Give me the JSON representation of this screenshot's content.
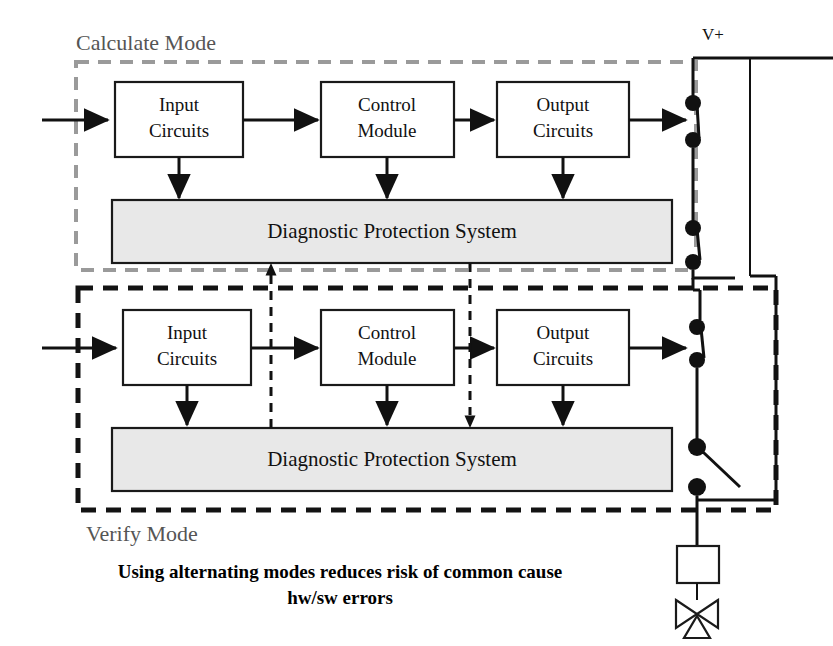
{
  "diagram": {
    "caption_line1": "Using alternating modes reduces risk of common cause",
    "caption_line2": "hw/sw errors",
    "power_rail_label": "V+",
    "colors": {
      "calculate_boundary": "#9a9a9a",
      "verify_boundary": "#131313",
      "dps_fill": "#e8e8e8",
      "block_fill": "#ffffff",
      "wire": "#111111"
    },
    "modes": [
      {
        "id": "calculate",
        "label": "Calculate Mode",
        "boundary_style": "dashed-gray",
        "blocks": [
          {
            "id": "input",
            "line1": "Input",
            "line2": "Circuits"
          },
          {
            "id": "control",
            "line1": "Control",
            "line2": "Module"
          },
          {
            "id": "output",
            "line1": "Output",
            "line2": "Circuits"
          }
        ],
        "diagnostic_bar": "Diagnostic Protection System"
      },
      {
        "id": "verify",
        "label": "Verify Mode",
        "boundary_style": "dashed-black",
        "blocks": [
          {
            "id": "input",
            "line1": "Input",
            "line2": "Circuits"
          },
          {
            "id": "control",
            "line1": "Control",
            "line2": "Module"
          },
          {
            "id": "output",
            "line1": "Output",
            "line2": "Circuits"
          }
        ],
        "diagnostic_bar": "Diagnostic Protection System"
      }
    ],
    "switches": [
      {
        "id": "sw-1",
        "state": "closed"
      },
      {
        "id": "sw-2",
        "state": "closed"
      },
      {
        "id": "sw-3",
        "state": "closed"
      },
      {
        "id": "sw-4",
        "state": "open"
      }
    ],
    "actuator": {
      "solenoid": "solenoid-coil",
      "valve": "control-valve"
    }
  }
}
